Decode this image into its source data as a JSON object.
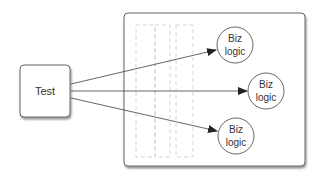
{
  "diagram": {
    "source_node": {
      "label": "Test"
    },
    "container": {
      "label": ""
    },
    "targets": [
      {
        "line1": "Biz",
        "line2": "logic"
      },
      {
        "line1": "Biz",
        "line2": "logic"
      },
      {
        "line1": "Biz",
        "line2": "logic"
      }
    ],
    "colors": {
      "stroke": "#555555",
      "dashed": "#cccccc",
      "text": "#333333",
      "shadow": "#999999"
    }
  }
}
